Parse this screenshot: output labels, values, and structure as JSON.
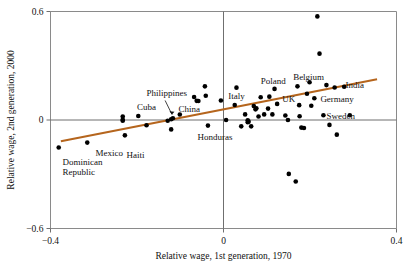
{
  "chart_data": {
    "type": "scatter",
    "title": "",
    "xlabel": "Relative wage, 1st generation, 1970",
    "ylabel": "Relative wage, 2nd generation, 2000",
    "xlim": [
      -0.4,
      0.4
    ],
    "ylim": [
      -0.6,
      0.6
    ],
    "xticks": [
      -0.4,
      0,
      0.4
    ],
    "xticklabels": [
      "−0.4",
      "0",
      "0.4"
    ],
    "yticks": [
      0.6,
      0,
      -0.6
    ],
    "yticklabels": [
      "0.6",
      "0",
      "−0.6"
    ],
    "grid": false,
    "legend": "none",
    "zero_lines": {
      "x": 0,
      "y": 0
    },
    "trendline": {
      "kind": "linear-fit",
      "color": "#b5651d",
      "x_start": -0.376,
      "y_start": -0.118,
      "x_end": 0.355,
      "y_end": 0.225
    },
    "points": [
      {
        "x": -0.381,
        "y": -0.152,
        "label": "Dominican Republic"
      },
      {
        "x": -0.315,
        "y": -0.125,
        "label": "Mexico"
      },
      {
        "x": -0.228,
        "y": -0.085,
        "label": "Haiti"
      },
      {
        "x": -0.233,
        "y": 0.019,
        "label": ""
      },
      {
        "x": -0.233,
        "y": -0.004,
        "label": ""
      },
      {
        "x": -0.233,
        "y": 0.002,
        "label": ""
      },
      {
        "x": -0.197,
        "y": 0.022,
        "label": "Cuba"
      },
      {
        "x": -0.178,
        "y": -0.029,
        "label": ""
      },
      {
        "x": -0.129,
        "y": -0.004,
        "label": ""
      },
      {
        "x": -0.121,
        "y": 0.004,
        "label": "Philippines"
      },
      {
        "x": -0.117,
        "y": 0.01,
        "label": ""
      },
      {
        "x": -0.121,
        "y": -0.052,
        "label": ""
      },
      {
        "x": -0.101,
        "y": 0.03,
        "label": "China"
      },
      {
        "x": -0.068,
        "y": 0.127,
        "label": ""
      },
      {
        "x": -0.062,
        "y": 0.106,
        "label": ""
      },
      {
        "x": -0.058,
        "y": 0.105,
        "label": ""
      },
      {
        "x": -0.043,
        "y": 0.186,
        "label": ""
      },
      {
        "x": -0.041,
        "y": 0.134,
        "label": ""
      },
      {
        "x": -0.036,
        "y": -0.031,
        "label": "Honduras"
      },
      {
        "x": -0.006,
        "y": 0.108,
        "label": ""
      },
      {
        "x": 0.006,
        "y": 0.0,
        "label": ""
      },
      {
        "x": 0.026,
        "y": 0.083,
        "label": "Italy"
      },
      {
        "x": 0.03,
        "y": 0.179,
        "label": ""
      },
      {
        "x": 0.041,
        "y": -0.035,
        "label": ""
      },
      {
        "x": 0.05,
        "y": 0.031,
        "label": ""
      },
      {
        "x": 0.056,
        "y": -0.002,
        "label": ""
      },
      {
        "x": 0.056,
        "y": -0.012,
        "label": ""
      },
      {
        "x": 0.058,
        "y": -0.009,
        "label": ""
      },
      {
        "x": 0.064,
        "y": -0.035,
        "label": ""
      },
      {
        "x": 0.07,
        "y": 0.077,
        "label": ""
      },
      {
        "x": 0.074,
        "y": 0.059,
        "label": ""
      },
      {
        "x": 0.076,
        "y": 0.065,
        "label": ""
      },
      {
        "x": 0.081,
        "y": 0.019,
        "label": ""
      },
      {
        "x": 0.086,
        "y": 0.126,
        "label": ""
      },
      {
        "x": 0.094,
        "y": 0.031,
        "label": ""
      },
      {
        "x": 0.103,
        "y": 0.063,
        "label": ""
      },
      {
        "x": 0.106,
        "y": 0.129,
        "label": ""
      },
      {
        "x": 0.113,
        "y": 0.031,
        "label": ""
      },
      {
        "x": 0.118,
        "y": 0.172,
        "label": "Poland"
      },
      {
        "x": 0.124,
        "y": 0.089,
        "label": "UK"
      },
      {
        "x": 0.143,
        "y": 0.025,
        "label": ""
      },
      {
        "x": 0.149,
        "y": 0.0,
        "label": ""
      },
      {
        "x": 0.151,
        "y": -0.298,
        "label": ""
      },
      {
        "x": 0.167,
        "y": -0.34,
        "label": ""
      },
      {
        "x": 0.171,
        "y": 0.186,
        "label": "Belgium"
      },
      {
        "x": 0.175,
        "y": 0.082,
        "label": ""
      },
      {
        "x": 0.176,
        "y": 0.021,
        "label": ""
      },
      {
        "x": 0.18,
        "y": -0.042,
        "label": ""
      },
      {
        "x": 0.186,
        "y": -0.044,
        "label": ""
      },
      {
        "x": 0.193,
        "y": 0.145,
        "label": ""
      },
      {
        "x": 0.199,
        "y": 0.209,
        "label": ""
      },
      {
        "x": 0.203,
        "y": 0.079,
        "label": ""
      },
      {
        "x": 0.21,
        "y": 0.12,
        "label": "Germany"
      },
      {
        "x": 0.217,
        "y": 0.573,
        "label": ""
      },
      {
        "x": 0.222,
        "y": 0.367,
        "label": ""
      },
      {
        "x": 0.231,
        "y": 0.026,
        "label": "Sweden"
      },
      {
        "x": 0.238,
        "y": 0.193,
        "label": ""
      },
      {
        "x": 0.245,
        "y": -0.027,
        "label": ""
      },
      {
        "x": 0.257,
        "y": 0.18,
        "label": "India"
      },
      {
        "x": 0.262,
        "y": -0.081,
        "label": ""
      },
      {
        "x": 0.279,
        "y": 0.184,
        "label": ""
      },
      {
        "x": 0.292,
        "y": 0.026,
        "label": ""
      }
    ],
    "annotations": [
      {
        "text": "Dominican",
        "x": -0.372,
        "y": -0.235
      },
      {
        "text": "Republic",
        "x": -0.372,
        "y": -0.29
      },
      {
        "text": "Mexico",
        "x": -0.296,
        "y": -0.185
      },
      {
        "text": "Haiti",
        "x": -0.224,
        "y": -0.195
      },
      {
        "text": "Cuba",
        "x": -0.2,
        "y": 0.072
      },
      {
        "text": "Philippines",
        "x": -0.178,
        "y": 0.148
      },
      {
        "text": "China",
        "x": -0.104,
        "y": 0.06
      },
      {
        "text": "Honduras",
        "x": -0.06,
        "y": -0.095
      },
      {
        "text": "Italy",
        "x": 0.011,
        "y": 0.13
      },
      {
        "text": "Poland",
        "x": 0.086,
        "y": 0.218
      },
      {
        "text": "UK",
        "x": 0.136,
        "y": 0.118
      },
      {
        "text": "Belgium",
        "x": 0.161,
        "y": 0.24
      },
      {
        "text": "Germany",
        "x": 0.224,
        "y": 0.118
      },
      {
        "text": "Sweden",
        "x": 0.238,
        "y": 0.022
      },
      {
        "text": "India",
        "x": 0.282,
        "y": 0.192
      }
    ]
  }
}
